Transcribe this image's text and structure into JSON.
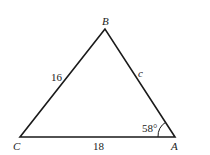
{
  "diagram": {
    "type": "triangle",
    "vertices": [
      {
        "name": "B",
        "x": 105,
        "y": 29,
        "label_x": 102,
        "label_y": 25
      },
      {
        "name": "C",
        "x": 20,
        "y": 137,
        "label_x": 13,
        "label_y": 150
      },
      {
        "name": "A",
        "x": 175,
        "y": 137,
        "label_x": 171,
        "label_y": 150
      }
    ],
    "sides": [
      {
        "name": "CB",
        "label": "16",
        "label_x": 51,
        "label_y": 81
      },
      {
        "name": "BA",
        "label": "c",
        "label_x": 138,
        "label_y": 77
      },
      {
        "name": "CA",
        "label": "18",
        "label_x": 93,
        "label_y": 150
      }
    ],
    "angle": {
      "vertex": "A",
      "label": "58°",
      "label_x": 142,
      "label_y": 132
    },
    "stroke_color": "#1a1a1a"
  }
}
